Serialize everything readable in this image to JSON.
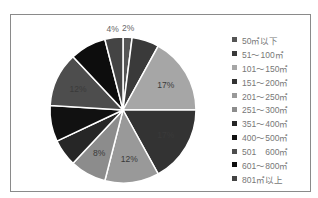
{
  "chart_data": {
    "type": "pie",
    "title": "",
    "categories": [
      "50㎡以下",
      "51～100㎡",
      "101～150㎡",
      "151～200㎡",
      "201～250㎡",
      "251～300㎡",
      "351～400㎡",
      "400～500㎡",
      "501　600㎡",
      "601～800㎡",
      "801㎡以上"
    ],
    "values": [
      2,
      6,
      17,
      17,
      12,
      8,
      6,
      8,
      12,
      8,
      4
    ],
    "data_labels": [
      "2%",
      "6%",
      "17%",
      "17%",
      "12%",
      "8%",
      "",
      "",
      "12%",
      "",
      "4%"
    ],
    "colors": [
      "#555555",
      "#3a3a3a",
      "#a6a6a6",
      "#333333",
      "#999999",
      "#8c8c8c",
      "#262626",
      "#111111",
      "#4d4d4d",
      "#0d0d0d",
      "#444444"
    ],
    "legend_position": "right",
    "start_angle": "top, clockwise"
  },
  "legend": [
    {
      "label": "50㎡以下"
    },
    {
      "label": "51～100㎡"
    },
    {
      "label": "101～150㎡"
    },
    {
      "label": "151～200㎡"
    },
    {
      "label": "201～250㎡"
    },
    {
      "label": "251～300㎡"
    },
    {
      "label": "351～400㎡"
    },
    {
      "label": "400～500㎡"
    },
    {
      "label": "501　600㎡"
    },
    {
      "label": "601～800㎡"
    },
    {
      "label": "801㎡以上"
    }
  ]
}
